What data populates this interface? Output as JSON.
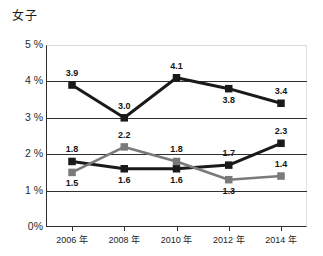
{
  "chart_data": {
    "type": "line",
    "title": "女子",
    "xlabel": "",
    "ylabel": "",
    "categories": [
      "2006 年",
      "2008 年",
      "2010 年",
      "2012 年",
      "2014 年"
    ],
    "ylim": [
      0,
      5
    ],
    "ytick_labels": [
      "0%",
      "1 %",
      "2 %",
      "3 %",
      "4 %",
      "5 %"
    ],
    "ytick_values": [
      0,
      1,
      2,
      3,
      4,
      5
    ],
    "grid": true,
    "grid_values": [
      1,
      2,
      3,
      4
    ],
    "legend_position": "none",
    "series": [
      {
        "name": "series-top",
        "color": "#1a1a1a",
        "marker": "square",
        "values": [
          3.9,
          3.0,
          4.1,
          3.8,
          3.4
        ],
        "labels": [
          "3.9",
          "3.0",
          "4.1",
          "3.8",
          "3.4"
        ]
      },
      {
        "name": "series-middle",
        "color": "#1a1a1a",
        "marker": "square",
        "values": [
          1.8,
          1.6,
          1.6,
          1.7,
          2.3
        ],
        "labels": [
          "1.8",
          "1.6",
          "1.6",
          "1.7",
          "2.3"
        ]
      },
      {
        "name": "series-gray",
        "color": "#7a7a7a",
        "marker": "square",
        "values": [
          1.5,
          2.2,
          1.8,
          1.3,
          1.4
        ],
        "labels": [
          "1.5",
          "2.2",
          "1.8",
          "1.3",
          "1.4"
        ]
      }
    ]
  },
  "colors": {
    "series_dark": "#1a1a1a",
    "series_gray": "#7a7a7a",
    "axis": "#2b2b2b",
    "grid": "#2f2f2f",
    "background": "#ffffff"
  }
}
